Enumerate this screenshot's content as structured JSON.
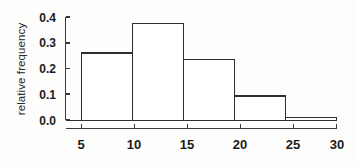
{
  "chart_data": {
    "type": "bar",
    "title": "",
    "subtitle": "",
    "xlabel": "",
    "ylabel": "relative frequency",
    "categories": [
      "5-10",
      "10-15",
      "15-20",
      "20-25",
      "25-30"
    ],
    "bin_edges": [
      5,
      10,
      15,
      20,
      25,
      30
    ],
    "values": [
      0.26,
      0.375,
      0.235,
      0.095,
      0.01
    ],
    "xlim": [
      5,
      30
    ],
    "ylim": [
      0.0,
      0.4
    ],
    "xticks": [
      5,
      10,
      15,
      20,
      25,
      30
    ],
    "xtick_labels": [
      "5",
      "10",
      "15",
      "20",
      "25",
      "30"
    ],
    "yticks": [
      0.0,
      0.1,
      0.2,
      0.3,
      0.4
    ],
    "ytick_labels": [
      "0.0",
      "0.1",
      "0.2",
      "0.3",
      "0.4"
    ],
    "grid": false,
    "legend": null,
    "bar_fill": "#ffffff",
    "bar_stroke": "#2e2e2e",
    "axis_color": "#3a3a3a",
    "background": "#fdfdfb"
  }
}
